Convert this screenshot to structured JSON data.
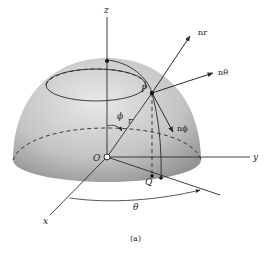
{
  "figure": {
    "caption": "(a)",
    "labels": {
      "z_axis": "z",
      "y_axis": "y",
      "x_axis": "x",
      "origin": "O",
      "point_p": "P",
      "point_q": "Q",
      "radius": "r",
      "phi": "ϕ",
      "theta": "θ",
      "n_r": "nr",
      "n_theta": "nθ",
      "n_phi": "nϕ"
    },
    "colors": {
      "hemisphere_light": "#e4e4e4",
      "hemisphere_dark": "#9a9a9a",
      "line": "#2a2a2a"
    }
  }
}
